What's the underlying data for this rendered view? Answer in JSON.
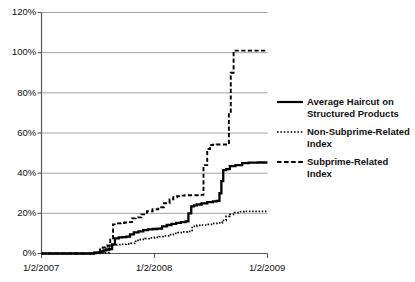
{
  "chart_data": {
    "type": "line",
    "title": "",
    "subtitle": "",
    "xlabel": "",
    "ylabel": "",
    "grid": true,
    "legend_position": "right",
    "ylim": [
      0,
      120
    ],
    "yticks": [
      0,
      20,
      40,
      60,
      80,
      100,
      120
    ],
    "ytick_labels": [
      "0%",
      "20%",
      "40%",
      "60%",
      "80%",
      "100%",
      "120%"
    ],
    "xlim": [
      0,
      24
    ],
    "xticks": [
      0,
      12,
      24
    ],
    "xtick_labels": [
      "1/2/2007",
      "1/2/2008",
      "1/2/2009"
    ],
    "x_unit": "months since 1/2/2007",
    "series": [
      {
        "name": "Average Haircut on Structured Products",
        "style": "solid",
        "color": "#000000",
        "x": [
          0,
          1,
          2,
          3,
          4,
          5,
          5.6,
          6.0,
          6.3,
          6.6,
          6.9,
          7.2,
          7.5,
          7.8,
          8.2,
          8.6,
          9.0,
          9.4,
          9.8,
          10.3,
          10.8,
          11.3,
          11.8,
          12.3,
          12.8,
          13.3,
          13.8,
          14.3,
          14.8,
          15.3,
          15.6,
          15.9,
          16.2,
          16.5,
          17.0,
          17.6,
          18.2,
          18.6,
          18.9,
          19.1,
          19.3,
          19.6,
          20.0,
          20.6,
          21.3,
          22.0,
          23.0,
          24.0
        ],
        "y": [
          0,
          0,
          0,
          0,
          0,
          0,
          0.3,
          0.6,
          1.0,
          1.6,
          2.0,
          2.2,
          4.5,
          7.5,
          8.0,
          8.2,
          8.4,
          9.5,
          10.5,
          11.0,
          11.6,
          12.0,
          12.2,
          12.4,
          13.5,
          14.2,
          14.8,
          15.2,
          15.6,
          16.0,
          20.0,
          23.5,
          24.0,
          24.4,
          25.0,
          25.6,
          26.0,
          26.2,
          30.0,
          36.0,
          41.5,
          42.0,
          43.5,
          44.0,
          45.0,
          45.2,
          45.3,
          45.3
        ]
      },
      {
        "name": "Non-Subprime-Related Index",
        "style": "dotted",
        "color": "#000000",
        "x": [
          0,
          1,
          2,
          3,
          4,
          5,
          5.6,
          6.0,
          6.4,
          6.8,
          7.2,
          7.6,
          8.0,
          8.5,
          9.0,
          9.5,
          10.0,
          10.5,
          11.0,
          11.5,
          12.0,
          12.5,
          13.0,
          13.5,
          14.0,
          14.5,
          15.0,
          15.5,
          16.0,
          16.5,
          17.0,
          17.6,
          18.2,
          18.8,
          19.2,
          19.6,
          20.0,
          20.5,
          21.0,
          21.5,
          22.0,
          23.0,
          24.0
        ],
        "y": [
          0,
          0,
          0,
          0,
          0,
          0,
          0,
          0,
          0.2,
          0.4,
          4.0,
          4.3,
          4.4,
          4.6,
          4.8,
          5.0,
          6.5,
          7.0,
          7.4,
          7.8,
          8.0,
          8.4,
          8.8,
          9.4,
          10.0,
          10.4,
          10.8,
          11.0,
          13.5,
          14.0,
          14.2,
          14.5,
          15.0,
          15.2,
          16.5,
          18.5,
          19.5,
          20.4,
          20.8,
          21.0,
          21.0,
          21.0,
          21.0
        ]
      },
      {
        "name": "Subprime-Related Index",
        "style": "dashed",
        "color": "#000000",
        "x": [
          0,
          1,
          2,
          3,
          4,
          5,
          5.5,
          5.9,
          6.2,
          6.5,
          6.8,
          7.0,
          7.3,
          7.6,
          8.0,
          8.4,
          8.8,
          9.2,
          9.6,
          10.0,
          10.6,
          11.2,
          11.8,
          12.4,
          13.0,
          13.6,
          14.0,
          14.4,
          14.8,
          15.2,
          15.6,
          16.0,
          16.4,
          16.8,
          17.2,
          17.6,
          17.9,
          18.2,
          18.6,
          19.0,
          19.4,
          19.7,
          19.9,
          20.1,
          20.4,
          21.0,
          22.0,
          23.0,
          24.0
        ],
        "y": [
          0,
          0,
          0,
          0,
          0,
          0,
          0.5,
          1.0,
          2.0,
          3.0,
          3.5,
          4.0,
          7.0,
          14.5,
          15.0,
          15.2,
          15.4,
          15.6,
          17.5,
          18.0,
          19.5,
          21.0,
          22.0,
          23.0,
          25.0,
          27.0,
          28.0,
          28.5,
          28.8,
          29.0,
          29.0,
          29.0,
          29.0,
          29.2,
          44.0,
          52.0,
          54.0,
          54.2,
          54.3,
          54.3,
          54.3,
          54.3,
          70.0,
          90.0,
          101.0,
          101.0,
          101.0,
          101.0,
          101.0
        ]
      }
    ]
  },
  "legend": {
    "entries": [
      {
        "label": "Average Haircut on Structured Products",
        "style": "solid"
      },
      {
        "label": "Non-Subprime-Related Index",
        "style": "dotted"
      },
      {
        "label": "Subprime-Related Index",
        "style": "dashed"
      }
    ]
  },
  "axes": {
    "y_labels": [
      "120%",
      "100%",
      "80%",
      "60%",
      "40%",
      "20%",
      "0%"
    ],
    "x_labels": [
      "1/2/2007",
      "1/2/2008",
      "1/2/2009"
    ]
  },
  "colors": {
    "line": "#000000",
    "grid": "#9a9a9a",
    "axis": "#595959",
    "background": "#ffffff",
    "text": "#111111"
  }
}
